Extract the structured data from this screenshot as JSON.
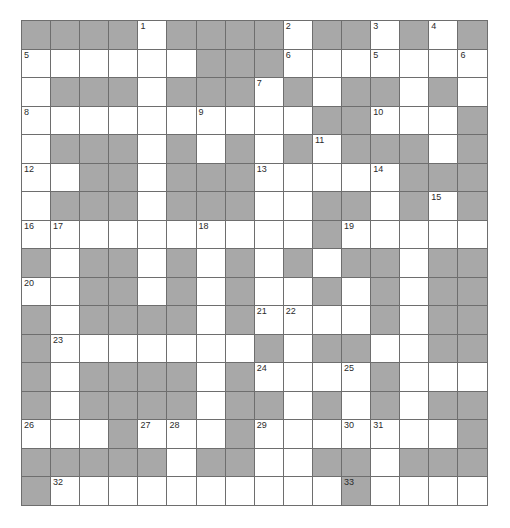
{
  "puzzle": {
    "title": "Crossword Grid",
    "type": "crossword-grid",
    "rows": 17,
    "cols": 16,
    "cell_size_px": 29,
    "colors": {
      "block": "#a8a8a8",
      "cell": "#ffffff",
      "gridline": "#6e6e6e",
      "border": "#4a4a4a",
      "number_text": "#2b2b2b",
      "page_background": "#ffffff"
    },
    "legend": {
      "block_symbol": "#",
      "open_symbol": "."
    },
    "grid": [
      "####.####.##.#.#",
      "......###.....+.",
      ".###.###.#.#.##.",
      "..........##....",
      ".###.#.#.#.#.##.",
      "..##.#.##......#",
      ".##..#.##.##..#.",
      "......................",
      "#.##.#.##.##.##.",
      "..##.#.#.#..#.#.",
      "#.####.#......#.",
      "#.......##.##.#.",
      "#.####.#....##..",
      "#.####.##.#.#.##",
      "...#....#...#...",
      "#####.##.#.##.##",
      "#..........#...."
    ],
    "grid_rows": [
      [
        "block",
        "block",
        "block",
        "block",
        "open",
        "block",
        "block",
        "block",
        "block",
        "open",
        "block",
        "block",
        "open",
        "block",
        "open",
        "block"
      ],
      [
        "open",
        "open",
        "open",
        "open",
        "open",
        "open",
        "block",
        "block",
        "block",
        "open",
        "open",
        "open",
        "open",
        "open",
        "open",
        "open"
      ],
      [
        "open",
        "block",
        "block",
        "block",
        "open",
        "block",
        "block",
        "block",
        "open",
        "block",
        "open",
        "block",
        "block",
        "open",
        "block",
        "open"
      ],
      [
        "open",
        "open",
        "open",
        "open",
        "open",
        "open",
        "open",
        "open",
        "open",
        "open",
        "block",
        "block",
        "open",
        "open",
        "open",
        "block"
      ],
      [
        "open",
        "block",
        "block",
        "block",
        "open",
        "block",
        "open",
        "block",
        "open",
        "block",
        "open",
        "block",
        "block",
        "block",
        "open",
        "block"
      ],
      [
        "open",
        "open",
        "block",
        "block",
        "open",
        "block",
        "block",
        "block",
        "open",
        "open",
        "open",
        "open",
        "open",
        "block",
        "block",
        "block"
      ],
      [
        "open",
        "block",
        "block",
        "block",
        "open",
        "block",
        "block",
        "block",
        "open",
        "open",
        "block",
        "block",
        "open",
        "block",
        "open",
        "block"
      ],
      [
        "open",
        "open",
        "open",
        "open",
        "open",
        "open",
        "open",
        "open",
        "open",
        "open",
        "block",
        "open",
        "open",
        "open",
        "open",
        "open"
      ],
      [
        "block",
        "open",
        "block",
        "block",
        "open",
        "block",
        "open",
        "block",
        "open",
        "block",
        "open",
        "block",
        "block",
        "open",
        "block",
        "block"
      ],
      [
        "open",
        "open",
        "block",
        "block",
        "open",
        "block",
        "open",
        "block",
        "open",
        "open",
        "block",
        "open",
        "block",
        "open",
        "block",
        "block"
      ],
      [
        "block",
        "open",
        "block",
        "block",
        "block",
        "block",
        "open",
        "block",
        "open",
        "open",
        "open",
        "open",
        "block",
        "open",
        "block",
        "block"
      ],
      [
        "block",
        "open",
        "open",
        "open",
        "open",
        "open",
        "open",
        "open",
        "block",
        "open",
        "block",
        "block",
        "open",
        "open",
        "block",
        "block"
      ],
      [
        "block",
        "open",
        "block",
        "block",
        "block",
        "block",
        "open",
        "block",
        "open",
        "open",
        "open",
        "open",
        "block",
        "open",
        "open",
        "open"
      ],
      [
        "block",
        "open",
        "block",
        "block",
        "block",
        "block",
        "open",
        "block",
        "block",
        "open",
        "block",
        "open",
        "block",
        "open",
        "block",
        "block"
      ],
      [
        "open",
        "open",
        "open",
        "block",
        "open",
        "open",
        "open",
        "block",
        "open",
        "open",
        "open",
        "open",
        "open",
        "open",
        "open",
        "block"
      ],
      [
        "block",
        "block",
        "block",
        "block",
        "block",
        "open",
        "block",
        "block",
        "open",
        "open",
        "block",
        "block",
        "open",
        "block",
        "block",
        "block"
      ],
      [
        "block",
        "open",
        "open",
        "open",
        "open",
        "open",
        "open",
        "open",
        "open",
        "open",
        "open",
        "block",
        "open",
        "open",
        "open",
        "open"
      ]
    ],
    "numbers": [
      {
        "n": "1",
        "row": 1,
        "col": 5
      },
      {
        "n": "2",
        "row": 1,
        "col": 10
      },
      {
        "n": "3",
        "row": 1,
        "col": 13
      },
      {
        "n": "4",
        "row": 1,
        "col": 15
      },
      {
        "n": "5",
        "row": 2,
        "col": 1
      },
      {
        "n": "6",
        "row": 2,
        "col": 10
      },
      {
        "n": "5",
        "row": 2,
        "col": 13
      },
      {
        "n": "6",
        "row": 2,
        "col": 16
      },
      {
        "n": "7",
        "row": 3,
        "col": 9
      },
      {
        "n": "8",
        "row": 4,
        "col": 1
      },
      {
        "n": "9",
        "row": 4,
        "col": 7
      },
      {
        "n": "10",
        "row": 4,
        "col": 13
      },
      {
        "n": "11",
        "row": 5,
        "col": 11
      },
      {
        "n": "12",
        "row": 6,
        "col": 1
      },
      {
        "n": "13",
        "row": 6,
        "col": 9
      },
      {
        "n": "14",
        "row": 6,
        "col": 13
      },
      {
        "n": "15",
        "row": 7,
        "col": 15
      },
      {
        "n": "16",
        "row": 8,
        "col": 1
      },
      {
        "n": "17",
        "row": 8,
        "col": 2
      },
      {
        "n": "18",
        "row": 8,
        "col": 7
      },
      {
        "n": "19",
        "row": 8,
        "col": 12
      },
      {
        "n": "20",
        "row": 10,
        "col": 1
      },
      {
        "n": "21",
        "row": 11,
        "col": 9
      },
      {
        "n": "22",
        "row": 11,
        "col": 10
      },
      {
        "n": "23",
        "row": 12,
        "col": 2
      },
      {
        "n": "24",
        "row": 13,
        "col": 9
      },
      {
        "n": "25",
        "row": 13,
        "col": 12
      },
      {
        "n": "26",
        "row": 15,
        "col": 1
      },
      {
        "n": "27",
        "row": 15,
        "col": 5
      },
      {
        "n": "28",
        "row": 15,
        "col": 6
      },
      {
        "n": "29",
        "row": 15,
        "col": 9
      },
      {
        "n": "30",
        "row": 15,
        "col": 12
      },
      {
        "n": "31",
        "row": 15,
        "col": 13
      },
      {
        "n": "32",
        "row": 17,
        "col": 2
      },
      {
        "n": "33",
        "row": 17,
        "col": 12
      }
    ]
  }
}
